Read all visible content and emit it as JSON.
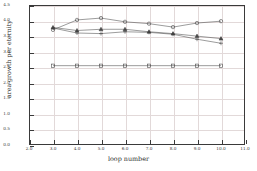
{
  "chart_data": {
    "type": "line",
    "title": "",
    "xlabel": "loop number",
    "ylabel": "area growth per eternity",
    "xlim": [
      2.0,
      11.0
    ],
    "ylim": [
      0.0,
      4.5
    ],
    "xticks": [
      "2.0",
      "3.0",
      "4.0",
      "5.0",
      "6.0",
      "7.0",
      "8.0",
      "9.0",
      "10.0",
      "11.0"
    ],
    "yticks": [
      "0.0",
      "0.5",
      "1.0",
      "1.5",
      "2.0",
      "2.5",
      "3.0",
      "3.5",
      "4.0",
      "4.5"
    ],
    "grid": true,
    "legend": "none",
    "x": [
      3.0,
      3.5,
      4.0,
      4.5,
      5.0,
      5.5,
      6.0,
      6.5,
      7.0,
      7.5,
      8.0,
      8.5,
      9.0,
      9.5,
      10.0
    ],
    "series": [
      {
        "name": "circle-series",
        "marker": "circle",
        "x": [
          3.0,
          4.0,
          5.0,
          6.0,
          7.0,
          8.0,
          9.0,
          10.0
        ],
        "values": [
          3.7,
          4.02,
          4.08,
          3.96,
          3.9,
          3.79,
          3.92,
          3.98
        ]
      },
      {
        "name": "triangle-series",
        "marker": "triangle",
        "x": [
          3.0,
          4.0,
          5.0,
          6.0,
          7.0,
          8.0,
          9.0,
          10.0
        ],
        "values": [
          3.78,
          3.68,
          3.72,
          3.72,
          3.64,
          3.58,
          3.5,
          3.42
        ]
      },
      {
        "name": "plus-series",
        "marker": "plus",
        "x": [
          3.0,
          4.0,
          5.0,
          6.0,
          7.0,
          8.0,
          9.0,
          10.0
        ],
        "values": [
          3.76,
          3.6,
          3.58,
          3.64,
          3.62,
          3.56,
          3.4,
          3.27
        ]
      },
      {
        "name": "square-series",
        "marker": "square",
        "x": [
          3.0,
          4.0,
          5.0,
          6.0,
          7.0,
          8.0,
          9.0,
          10.0
        ],
        "values": [
          2.55,
          2.55,
          2.55,
          2.55,
          2.55,
          2.55,
          2.55,
          2.55
        ]
      }
    ],
    "colors": {
      "line": "#4a4a4a",
      "marker": "#3d3d3d",
      "grid": "#e2d9d9",
      "axis": "#3a3a3a",
      "background": "#ffffff"
    }
  }
}
